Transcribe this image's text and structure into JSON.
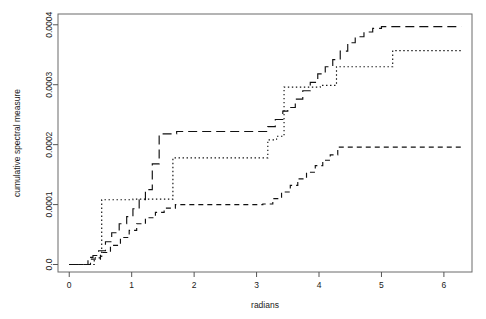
{
  "chart_data": {
    "type": "line",
    "title": "",
    "subtitle": "",
    "xlabel": "radians",
    "ylabel": "cumulative spectral measure",
    "xlim": [
      -0.18,
      6.45
    ],
    "ylim": [
      -1.25e-05,
      0.000418
    ],
    "xticks": [
      0,
      1,
      2,
      3,
      4,
      5,
      6
    ],
    "xtick_labels": [
      "0",
      "1",
      "2",
      "3",
      "4",
      "5",
      "6"
    ],
    "yticks": [
      0,
      0.0001,
      0.0002,
      0.0003,
      0.0004
    ],
    "ytick_labels": [
      "0.0",
      "0.0001",
      "0.0002",
      "0.0003",
      "0.0004"
    ],
    "grid": false,
    "legend": "none",
    "box": "full",
    "series": [
      {
        "name": "long-dash curve",
        "style": "long-dash",
        "dash": "9,5",
        "color": "#111111",
        "step": "hv",
        "x": [
          0.0,
          0.16,
          0.3,
          0.38,
          0.47,
          0.58,
          0.68,
          0.8,
          0.92,
          1.02,
          1.12,
          1.22,
          1.33,
          1.44,
          1.72,
          2.1,
          2.6,
          3.05,
          3.18,
          3.3,
          3.42,
          3.5,
          3.62,
          3.74,
          3.86,
          3.98,
          4.1,
          4.22,
          4.34,
          4.46,
          4.58,
          4.72,
          4.86,
          5.0,
          5.4,
          5.9,
          6.28
        ],
        "y": [
          0.0,
          0.0,
          1.2e-05,
          1.5e-05,
          2.3e-05,
          3.8e-05,
          5.3e-05,
          6.8e-05,
          8e-05,
          9.3e-05,
          0.000108,
          0.000125,
          0.000168,
          0.000218,
          0.000222,
          0.000222,
          0.000222,
          0.000222,
          0.00023,
          0.000242,
          0.000256,
          0.000262,
          0.000276,
          0.00029,
          0.000304,
          0.000318,
          0.00033,
          0.000342,
          0.000356,
          0.00037,
          0.00038,
          0.000388,
          0.000394,
          0.000397,
          0.000397,
          0.000397,
          0.000397
        ]
      },
      {
        "name": "dotted curve",
        "style": "dotted",
        "dash": "1.4,2.6",
        "color": "#111111",
        "step": "hv",
        "x": [
          0.0,
          0.4,
          0.4,
          0.52,
          0.52,
          1.02,
          1.02,
          1.66,
          1.66,
          3.18,
          3.18,
          3.32,
          3.32,
          3.44,
          3.44,
          4.02,
          4.02,
          4.28,
          4.28,
          5.18,
          5.18,
          6.28
        ],
        "y": [
          0.0,
          0.0,
          1.1e-05,
          1.1e-05,
          0.000108,
          0.000108,
          0.000109,
          0.000109,
          0.000178,
          0.000178,
          0.000208,
          0.000208,
          0.000214,
          0.000214,
          0.000296,
          0.000296,
          0.000299,
          0.000299,
          0.00033,
          0.00033,
          0.000357,
          0.000357
        ]
      },
      {
        "name": "short-dash curve",
        "style": "short-dash",
        "dash": "5,4",
        "color": "#111111",
        "step": "hv",
        "x": [
          0.0,
          0.18,
          0.34,
          0.5,
          0.66,
          0.82,
          0.96,
          1.08,
          1.22,
          1.38,
          1.52,
          1.7,
          2.1,
          2.6,
          3.1,
          3.26,
          3.4,
          3.54,
          3.66,
          3.8,
          3.94,
          4.06,
          4.18,
          4.3,
          4.6,
          5.2,
          5.8,
          6.28
        ],
        "y": [
          0.0,
          0.0,
          9e-06,
          2e-05,
          3.2e-05,
          4.5e-05,
          5.7e-05,
          6.8e-05,
          7.8e-05,
          8.7e-05,
          9.4e-05,
          0.0001,
          0.0001,
          0.0001,
          0.000101,
          0.00011,
          0.000121,
          0.000132,
          0.000143,
          0.000154,
          0.000165,
          0.000174,
          0.000183,
          0.000196,
          0.000196,
          0.000196,
          0.000196,
          0.000196
        ]
      }
    ]
  },
  "figure": {
    "background_color": "#ffffff",
    "axis_color": "#555555",
    "box_color": "#6b6b6b",
    "curve_color": "#111111"
  }
}
